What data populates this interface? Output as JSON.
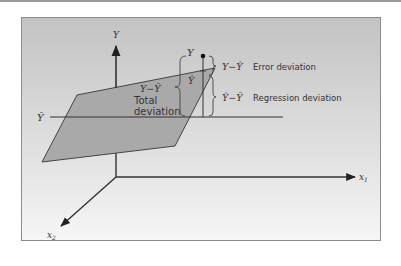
{
  "figure": {
    "type": "3d-regression-plane-deviation-diagram",
    "axes": {
      "y": "Y",
      "x1": "x",
      "x1_sub": "1",
      "x2": "x",
      "x2_sub": "2"
    },
    "mean_line_label": "Ȳ",
    "total_deviation": {
      "formula": "Y−Ȳ",
      "label_line1": "Total",
      "label_line2": "deviation"
    },
    "point_label": "Y",
    "predicted_label": "Ŷ",
    "error_deviation": {
      "formula": "Y−Ŷ",
      "label": "Error deviation"
    },
    "regression_deviation": {
      "formula": "Ŷ−Ȳ",
      "label": "Regression deviation"
    },
    "colors": {
      "background_top": "#c4c4c4",
      "background_bottom": "#f4f4f4",
      "plane": "#a9a9a9",
      "lines": "#333333",
      "border": "#8c8c8c"
    }
  }
}
